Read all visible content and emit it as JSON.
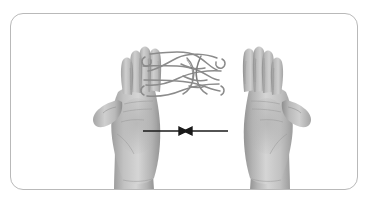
{
  "panel": {
    "border_color": "#b9b9b9",
    "background_color": "#ffffff",
    "corner_radius": "13px"
  },
  "illustration": {
    "kind": "photograph",
    "subject": "string-figure-between-two-hands",
    "color_mode": "grayscale",
    "description": "Two open palm-up hands facing the viewer with a looped string figure woven across the fingertips",
    "hands": [
      {
        "side": "left",
        "orientation": "palm-up",
        "thumb_direction": "outward-left",
        "fingers_visible": 4,
        "holds_string": true
      },
      {
        "side": "right",
        "orientation": "palm-up",
        "thumb_direction": "outward-right",
        "fingers_visible": 4,
        "holds_string": true
      }
    ],
    "string": {
      "label": "loop-string",
      "color": "#8e8e8e",
      "crossings": 6
    },
    "arrows": [
      {
        "label": "move-left-hand-inward",
        "direction": "right",
        "from_x": 143,
        "to_x": 182,
        "y": 131
      },
      {
        "label": "move-right-hand-inward",
        "direction": "left",
        "from_x": 228,
        "to_x": 189,
        "y": 131
      }
    ],
    "arrow_color": "#1a1a1a",
    "skin_tones": {
      "highlight": "#e8e8e8",
      "mid": "#bdbdbd",
      "shadow": "#8f8f8f",
      "deep_shadow": "#6e6e6e"
    }
  }
}
